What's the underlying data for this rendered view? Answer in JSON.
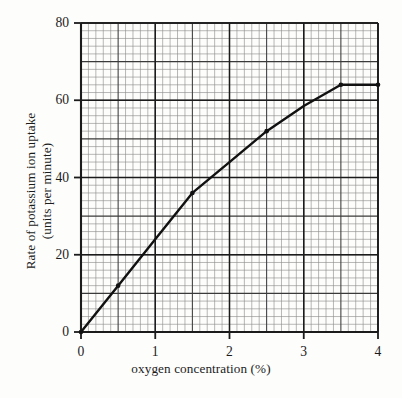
{
  "chart_data": {
    "type": "line",
    "title": "",
    "xlabel": "oxygen concentration (%)",
    "ylabel_line1": "Rate of potassium ion uptake",
    "ylabel_line2": "(units per minute)",
    "xlim": [
      0,
      4
    ],
    "ylim": [
      0,
      80
    ],
    "xticks": [
      "0",
      "1",
      "2",
      "3",
      "4"
    ],
    "xtick_values": [
      0,
      1,
      2,
      3,
      4
    ],
    "yticks": [
      "0",
      "20",
      "40",
      "60",
      "80"
    ],
    "ytick_values": [
      0,
      20,
      40,
      60,
      80
    ],
    "grid": "on",
    "grid_minor_x_divisions": 10,
    "grid_minor_y_divisions": 10,
    "grid_major_every": 5,
    "legend": "none",
    "series": [
      {
        "name": "Rate of potassium ion uptake",
        "x": [
          0,
          0.5,
          1,
          1.5,
          2,
          2.5,
          3,
          3.5,
          4
        ],
        "values": [
          0,
          12,
          24,
          36,
          44,
          52,
          58.5,
          64,
          64
        ],
        "line_color": "#111111",
        "line_width": 2.4,
        "markers": [
          {
            "x": 0,
            "y": 0
          },
          {
            "x": 0.5,
            "y": 12
          },
          {
            "x": 1.5,
            "y": 36
          },
          {
            "x": 2.5,
            "y": 52
          },
          {
            "x": 3.5,
            "y": 64
          },
          {
            "x": 4,
            "y": 64
          }
        ]
      }
    ]
  },
  "colors": {
    "background": "#fdfdfb",
    "axis": "#1b1b1b",
    "grid_minor": "#8b8b8b",
    "grid_major": "#3a3a3a",
    "data_line": "#111111"
  }
}
